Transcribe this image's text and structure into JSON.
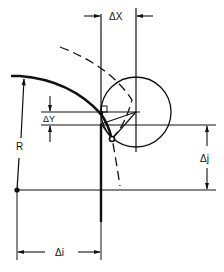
{
  "diagram": {
    "labels": {
      "delta_x": "ΔX",
      "delta_y": "ΔY",
      "radius": "R",
      "delta_i": "Δi",
      "delta_j": "Δj"
    },
    "colors": {
      "ink": "#111111",
      "background": "#ffffff"
    }
  }
}
